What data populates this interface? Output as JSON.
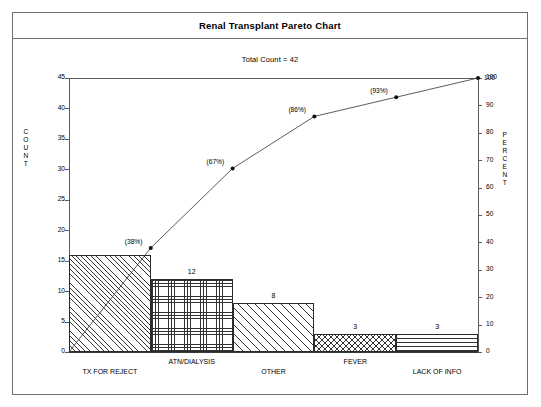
{
  "window": {
    "title": "Renal Transplant Pareto Chart",
    "subtitle": "Total Count = 42"
  },
  "axes": {
    "left_title_letters": [
      "C",
      "O",
      "U",
      "N",
      "T"
    ],
    "right_title_letters": [
      "P",
      "E",
      "R",
      "C",
      "E",
      "N",
      "T"
    ],
    "left_ticks": [
      "0",
      "5",
      "10",
      "15",
      "20",
      "25",
      "30",
      "35",
      "40",
      "45"
    ],
    "right_ticks": [
      "0",
      "10",
      "20",
      "30",
      "40",
      "50",
      "60",
      "70",
      "80",
      "90",
      "100"
    ]
  },
  "chart_data": {
    "type": "bar",
    "title": "Renal Transplant Pareto Chart",
    "subtitle": "Total Count = 42",
    "total_count": 42,
    "categories": [
      "TX FOR REJECT",
      "ATN/DIALYSIS",
      "OTHER",
      "FEVER",
      "LACK OF INFO"
    ],
    "values": [
      16,
      12,
      8,
      3,
      3
    ],
    "bar_labels": [
      "",
      "12",
      "8",
      "3",
      "3"
    ],
    "cumulative_percent": [
      38,
      67,
      86,
      93,
      100
    ],
    "cumulative_labels": [
      "(38%)",
      "(67%)",
      "(86%)",
      "(93%)",
      "100"
    ],
    "bar_patterns": [
      "diagonal-dense",
      "cross-grid",
      "diagonal-open",
      "diamond",
      "horizontal-lines"
    ],
    "xlabel": "",
    "ylabel": "COUNT",
    "y2label": "PERCENT",
    "ylim": [
      0,
      45
    ],
    "y2lim": [
      0,
      100
    ],
    "ytick_step": 5,
    "y2tick_step": 10,
    "grid": false,
    "legend": "none"
  },
  "colors": {
    "frame": "#6f6f6f",
    "axis": "#5a5a5a",
    "bar_outline": "#2b2b2b",
    "line": "#333333",
    "background": "#ffffff"
  }
}
